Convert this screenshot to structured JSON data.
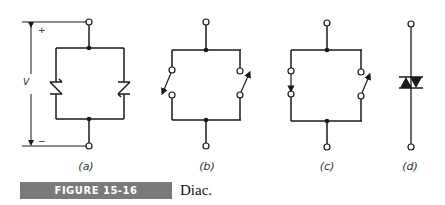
{
  "figure": {
    "number_label": "FIGURE 15-16",
    "caption": "Diac.",
    "caption_bar_color": "#7a7a7a"
  },
  "panels": [
    {
      "id": "a",
      "label": "(a)",
      "description": "Two parallel, oppositely oriented four-layer (Shockley) diodes between two terminals, with voltage V indicated"
    },
    {
      "id": "b",
      "label": "(b)",
      "description": "Equivalent switch model, both switches open"
    },
    {
      "id": "c",
      "label": "(c)",
      "description": "Equivalent switch model, left switch closed, right switch open"
    },
    {
      "id": "d",
      "label": "(d)",
      "description": "Diac schematic symbol"
    }
  ],
  "voltage": {
    "symbol": "V",
    "plus": "+",
    "minus": "−"
  },
  "colors": {
    "line": "#1a1a1a",
    "background": "#ffffff"
  }
}
